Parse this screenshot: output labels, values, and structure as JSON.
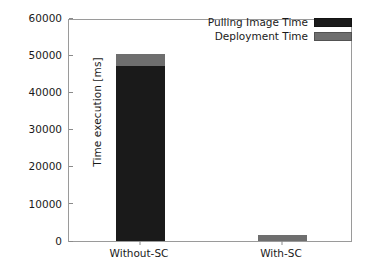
{
  "chart_data": {
    "type": "bar",
    "subtype": "stacked-vertical",
    "title": "",
    "xlabel": "",
    "ylabel": "Time execution [ms]",
    "categories": [
      "Without-SC",
      "With-SC"
    ],
    "series": [
      {
        "name": "Pulling Image Time",
        "color": "#1a1a1a",
        "values": [
          47200,
          0
        ]
      },
      {
        "name": "Deployment Time",
        "color": "#6e6e6e",
        "values": [
          3200,
          1600
        ]
      }
    ],
    "totals": [
      50400,
      1600
    ],
    "ylim": [
      0,
      60000
    ],
    "ytick_values": [
      0,
      10000,
      20000,
      30000,
      40000,
      50000,
      60000
    ],
    "ytick_labels": [
      "0",
      "10000",
      "20000",
      "30000",
      "40000",
      "50000",
      "60000"
    ],
    "grid": false,
    "legend_position": "upper right",
    "frame": true
  },
  "axes": {
    "y_label": "Time execution [ms]"
  },
  "legend": {
    "items": [
      {
        "label": "Pulling Image Time",
        "color": "#1a1a1a"
      },
      {
        "label": "Deployment Time",
        "color": "#6e6e6e"
      }
    ]
  },
  "colors": {
    "pulling_image_time": "#1a1a1a",
    "deployment_time": "#6e6e6e",
    "frame": "#9a9a9a",
    "text": "#1a1a1a",
    "background": "#ffffff"
  }
}
